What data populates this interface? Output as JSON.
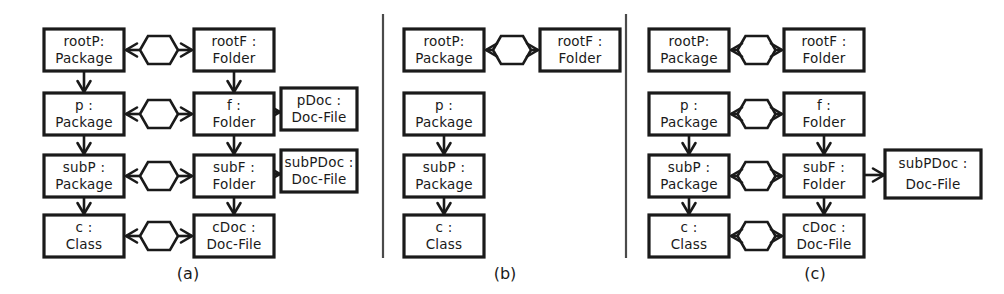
{
  "figure": {
    "background_color": "#ffffff",
    "line_color": "#1a1a1a",
    "divider_color": "#4a4a4a",
    "panels": [
      {
        "id": "a",
        "caption": "(a)",
        "nodes": [
          {
            "id": "a-rootP",
            "line1": "rootP:",
            "line2": "Package",
            "x": 44,
            "y": 29,
            "w": 80,
            "h": 42
          },
          {
            "id": "a-rootF",
            "line1": "rootF :",
            "line2": "Folder",
            "x": 194,
            "y": 29,
            "w": 80,
            "h": 42
          },
          {
            "id": "a-p",
            "line1": "p :",
            "line2": "Package",
            "x": 44,
            "y": 93,
            "w": 80,
            "h": 42
          },
          {
            "id": "a-f",
            "line1": "f :",
            "line2": "Folder",
            "x": 194,
            "y": 93,
            "w": 80,
            "h": 42
          },
          {
            "id": "a-pDoc",
            "line1": "pDoc :",
            "line2": "Doc-File",
            "x": 281,
            "y": 88,
            "w": 76,
            "h": 42
          },
          {
            "id": "a-subP",
            "line1": "subP :",
            "line2": "Package",
            "x": 44,
            "y": 155,
            "w": 80,
            "h": 42
          },
          {
            "id": "a-subF",
            "line1": "subF :",
            "line2": "Folder",
            "x": 194,
            "y": 155,
            "w": 80,
            "h": 42
          },
          {
            "id": "a-subPDoc",
            "line1": "subPDoc :",
            "line2": "Doc-File",
            "x": 281,
            "y": 150,
            "w": 76,
            "h": 42
          },
          {
            "id": "a-c",
            "line1": "c :",
            "line2": "Class",
            "x": 44,
            "y": 215,
            "w": 80,
            "h": 42
          },
          {
            "id": "a-cDoc",
            "line1": "cDoc :",
            "line2": "Doc-File",
            "x": 194,
            "y": 215,
            "w": 80,
            "h": 42
          }
        ],
        "correspondences": [
          {
            "from": "a-rootP",
            "to": "a-rootF",
            "cy": 50
          },
          {
            "from": "a-p",
            "to": "a-f",
            "cy": 114
          },
          {
            "from": "a-subP",
            "to": "a-subF",
            "cy": 176
          },
          {
            "from": "a-c",
            "to": "a-cDoc",
            "cy": 236
          }
        ],
        "containments": [
          {
            "from": "a-rootP",
            "to": "a-p"
          },
          {
            "from": "a-p",
            "to": "a-subP"
          },
          {
            "from": "a-subP",
            "to": "a-c"
          },
          {
            "from": "a-rootF",
            "to": "a-f"
          },
          {
            "from": "a-f",
            "to": "a-subF"
          },
          {
            "from": "a-subF",
            "to": "a-cDoc"
          },
          {
            "from": "a-f",
            "to": "a-pDoc"
          },
          {
            "from": "a-subF",
            "to": "a-subPDoc"
          }
        ]
      },
      {
        "id": "b",
        "caption": "(b)",
        "nodes": [
          {
            "id": "b-rootP",
            "line1": "rootP:",
            "line2": "Package",
            "x": 404,
            "y": 29,
            "w": 80,
            "h": 42
          },
          {
            "id": "b-rootF",
            "line1": "rootF :",
            "line2": "Folder",
            "x": 540,
            "y": 29,
            "w": 80,
            "h": 42
          },
          {
            "id": "b-p",
            "line1": "p :",
            "line2": "Package",
            "x": 404,
            "y": 93,
            "w": 80,
            "h": 42
          },
          {
            "id": "b-subP",
            "line1": "subP :",
            "line2": "Package",
            "x": 404,
            "y": 155,
            "w": 80,
            "h": 42
          },
          {
            "id": "b-c",
            "line1": "c :",
            "line2": "Class",
            "x": 404,
            "y": 215,
            "w": 80,
            "h": 42
          }
        ],
        "correspondences": [
          {
            "from": "b-rootP",
            "to": "b-rootF",
            "cy": 50
          }
        ],
        "containments": [
          {
            "from": "b-p",
            "to": "b-subP"
          },
          {
            "from": "b-subP",
            "to": "b-c"
          }
        ]
      },
      {
        "id": "c",
        "caption": "(c)",
        "nodes": [
          {
            "id": "c-rootP",
            "line1": "rootP:",
            "line2": "Package",
            "x": 649,
            "y": 29,
            "w": 80,
            "h": 42
          },
          {
            "id": "c-rootF",
            "line1": "rootF :",
            "line2": "Folder",
            "x": 784,
            "y": 29,
            "w": 80,
            "h": 42
          },
          {
            "id": "c-p",
            "line1": "p :",
            "line2": "Package",
            "x": 649,
            "y": 93,
            "w": 80,
            "h": 42
          },
          {
            "id": "c-f",
            "line1": "f :",
            "line2": "Folder",
            "x": 784,
            "y": 93,
            "w": 80,
            "h": 42
          },
          {
            "id": "c-subP",
            "line1": "subP :",
            "line2": "Package",
            "x": 649,
            "y": 155,
            "w": 80,
            "h": 42
          },
          {
            "id": "c-subF",
            "line1": "subF :",
            "line2": "Folder",
            "x": 784,
            "y": 155,
            "w": 80,
            "h": 42
          },
          {
            "id": "c-subPDoc",
            "line1": "subPDoc :",
            "line2": "Doc-File",
            "x": 885,
            "y": 150,
            "w": 96,
            "h": 48
          },
          {
            "id": "c-c",
            "line1": "c :",
            "line2": "Class",
            "x": 649,
            "y": 215,
            "w": 80,
            "h": 42
          },
          {
            "id": "c-cDoc",
            "line1": "cDoc :",
            "line2": "Doc-File",
            "x": 784,
            "y": 215,
            "w": 80,
            "h": 42
          }
        ],
        "correspondences": [
          {
            "from": "c-rootP",
            "to": "c-rootF",
            "cy": 50
          },
          {
            "from": "c-p",
            "to": "c-f",
            "cy": 114
          },
          {
            "from": "c-subP",
            "to": "c-subF",
            "cy": 176
          },
          {
            "from": "c-c",
            "to": "c-cDoc",
            "cy": 236
          }
        ],
        "containments": [
          {
            "from": "c-p",
            "to": "c-subP"
          },
          {
            "from": "c-subP",
            "to": "c-c"
          },
          {
            "from": "c-f",
            "to": "c-subF"
          },
          {
            "from": "c-subF",
            "to": "c-cDoc"
          },
          {
            "from": "c-subF",
            "to": "c-subPDoc"
          }
        ]
      }
    ],
    "dividers": [
      {
        "x": 383,
        "y1": 14,
        "y2": 258
      },
      {
        "x": 626,
        "y": 14,
        "y1": 14,
        "y2": 258
      }
    ],
    "captions": [
      {
        "text": "(a)",
        "x": 188,
        "y": 279
      },
      {
        "text": "(b)",
        "x": 505,
        "y": 279
      },
      {
        "text": "(c)",
        "x": 815,
        "y": 279
      }
    ]
  }
}
